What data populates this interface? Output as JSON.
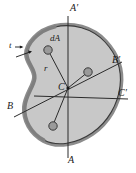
{
  "figure": {
    "type": "engineering-cross-section-diagram",
    "colors": {
      "background": "#ffffff",
      "section_fill": "#c8c8c8",
      "section_edge_band": "#8c8c8c",
      "outline": "#3a3a3a",
      "axis_line": "#2b2b2b",
      "element_dot_fill": "#9a9a9a",
      "element_dot_stroke": "#3a3a3a",
      "label_text": "#1a1a1a"
    },
    "labels": {
      "axis_a_top": "A′",
      "axis_a_bottom": "A",
      "axis_b_left": "B",
      "axis_b_right": "B′",
      "axis_c_right": "C′",
      "centroid": "C",
      "area_element": "dA",
      "radius": "r",
      "thickness": "t"
    },
    "axes": [
      {
        "name": "A-A'",
        "start_label": "A",
        "end_label": "A′",
        "orientation": "vertical"
      },
      {
        "name": "B-B'",
        "start_label": "B",
        "end_label": "B′",
        "orientation": "oblique-rising"
      },
      {
        "name": "C-C'",
        "start_label": "C",
        "end_label": "C′",
        "orientation": "oblique-shallow"
      }
    ],
    "area_elements": [
      {
        "name": "dA-upper-left",
        "labeled": "dA",
        "radius_line": "r"
      },
      {
        "name": "dA-upper-right",
        "labeled": "",
        "radius_line": ""
      },
      {
        "name": "dA-lower",
        "labeled": "",
        "radius_line": ""
      }
    ]
  }
}
